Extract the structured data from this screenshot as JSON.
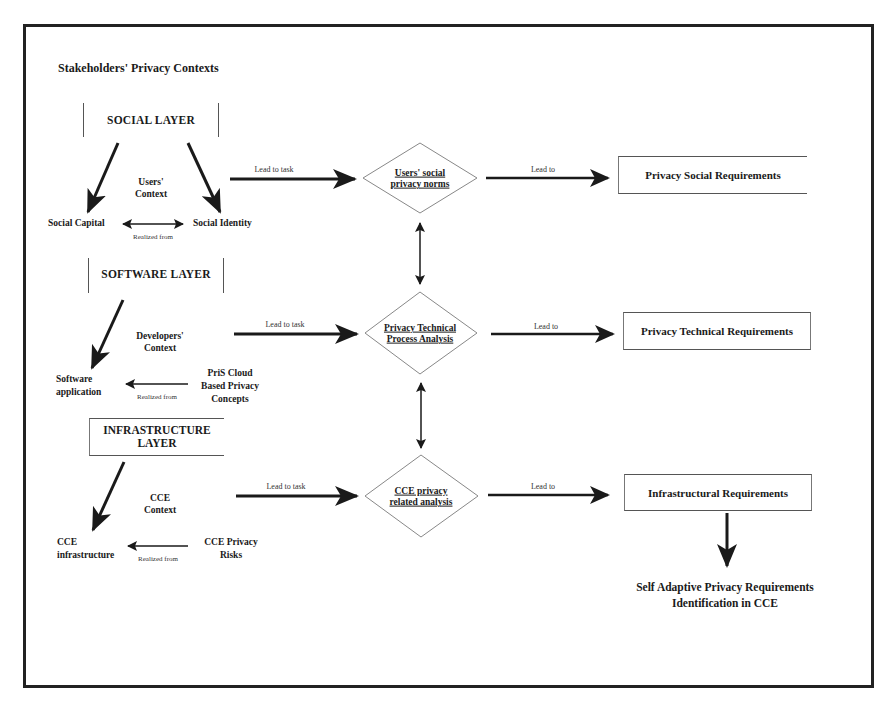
{
  "title": "Stakeholders' Privacy Contexts",
  "layers": {
    "social": {
      "label": "SOCIAL LAYER",
      "context": [
        "Users'",
        "Context"
      ],
      "left_node": "Social Capital",
      "right_node": "Social Identity",
      "relation_label": "Realized from"
    },
    "software": {
      "label": "SOFTWARE LAYER",
      "context": [
        "Developers'",
        "Context"
      ],
      "left_node": [
        "Software",
        "application"
      ],
      "right_node": [
        "PriS Cloud",
        "Based Privacy",
        "Concepts"
      ],
      "relation_label": "Realized from"
    },
    "infrastructure": {
      "label": [
        "INFRASTRUCTURE",
        "LAYER"
      ],
      "context": [
        "CCE",
        "Context"
      ],
      "left_node": [
        "CCE",
        "infrastructure"
      ],
      "right_node": [
        "CCE Privacy",
        "Risks"
      ],
      "relation_label": "Realized from"
    }
  },
  "analyses": [
    {
      "label": [
        "Users' social",
        "privacy norms"
      ],
      "arrow_in_label": "Lead to task",
      "arrow_out_label": "Lead to"
    },
    {
      "label": [
        "Privacy Technical",
        "Process Analysis"
      ],
      "arrow_in_label": "Lead to task",
      "arrow_out_label": "Lead to"
    },
    {
      "label": [
        "CCE privacy",
        "related analysis"
      ],
      "arrow_in_label": "Lead to task",
      "arrow_out_label": "Lead to"
    }
  ],
  "requirements": [
    "Privacy Social Requirements",
    "Privacy Technical Requirements",
    "Infrastructural Requirements"
  ],
  "outcome": [
    "Self Adaptive Privacy Requirements",
    "Identification in CCE"
  ],
  "colors": {
    "ink": "#1a1a1a",
    "frame": "#222222",
    "diamond_stroke": "#888888",
    "box_stroke": "#666666"
  }
}
